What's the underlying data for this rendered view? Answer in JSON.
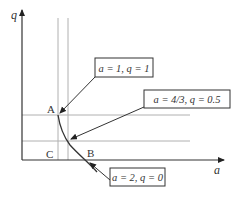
{
  "axes": {
    "y_label": "q",
    "x_label": "a"
  },
  "points": {
    "A": "A",
    "B": "B",
    "C": "C"
  },
  "annotations": [
    {
      "id": "point-a1-q1",
      "text": "a = 1, q = 1",
      "a": 1,
      "q": 1
    },
    {
      "id": "point-a43-q05",
      "text": "a = 4/3, q = 0.5",
      "a": "4/3",
      "q": 0.5
    },
    {
      "id": "point-a2-q0",
      "text": "a = 2, q = 0",
      "a": 2,
      "q": 0
    }
  ],
  "colors": {
    "line": "#333333",
    "guide": "#aaaaaa",
    "background": "#ffffff"
  }
}
